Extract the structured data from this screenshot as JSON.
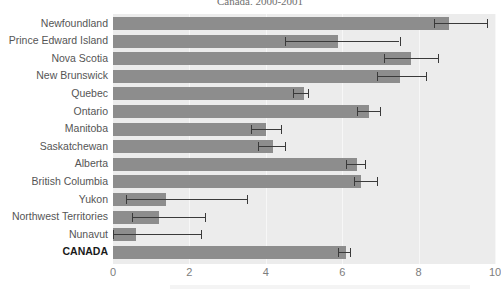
{
  "chart_data": {
    "type": "bar",
    "orientation": "horizontal",
    "title": "Canada, 2000-2001",
    "xlabel": "",
    "ylabel": "",
    "xlim": [
      0,
      10
    ],
    "xticks": [
      0,
      2,
      4,
      6,
      8,
      10
    ],
    "xtick_labels": [
      "0",
      "2",
      "4",
      "6",
      "8",
      "10"
    ],
    "grid": true,
    "legend": "none",
    "error_bars": true,
    "categories": [
      "Newfoundland",
      "Prince Edward Island",
      "Nova Scotia",
      "New Brunswick",
      "Quebec",
      "Ontario",
      "Manitoba",
      "Saskatchewan",
      "Alberta",
      "British Columbia",
      "Yukon",
      "Northwest Territories",
      "Nunavut",
      "CANADA"
    ],
    "values": [
      8.8,
      5.9,
      7.8,
      7.5,
      5.0,
      6.7,
      4.0,
      4.2,
      6.4,
      6.5,
      1.4,
      1.2,
      0.6,
      6.1
    ],
    "error_low": [
      8.4,
      4.5,
      7.1,
      6.9,
      4.7,
      6.4,
      3.6,
      3.8,
      6.1,
      6.3,
      0.35,
      0.5,
      0.0,
      5.9
    ],
    "error_high": [
      9.8,
      7.5,
      8.5,
      8.2,
      5.1,
      7.0,
      4.4,
      4.5,
      6.6,
      6.9,
      3.5,
      2.4,
      2.3,
      6.2
    ],
    "emphasis_index": 13,
    "bar_color": "#8d8d8d",
    "plot_background": "#ececec",
    "error_color": "#3a3a3a"
  }
}
